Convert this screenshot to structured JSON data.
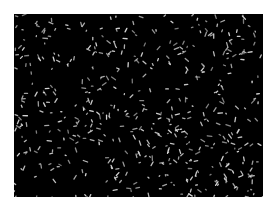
{
  "image": {
    "description": "Micrograph of many small bright rod-shaped particles on a black background",
    "background_color": "#000000",
    "particle_color": "#d8d8d8",
    "page_background": "#ffffff",
    "particle_count_approx": 520,
    "seed": 7
  }
}
